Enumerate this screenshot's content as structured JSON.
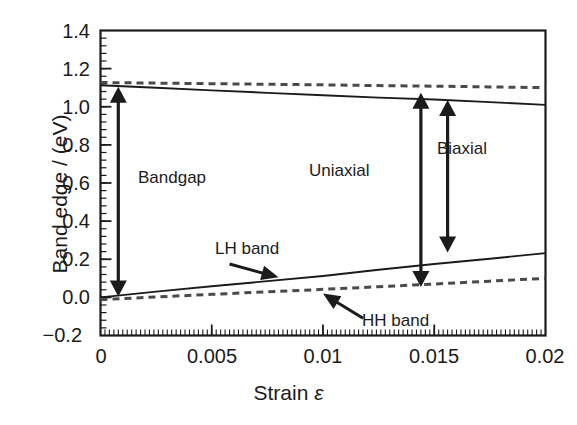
{
  "chart_data": {
    "type": "line",
    "title": "",
    "xlabel": "Strain ε",
    "ylabel": "Band edge / (eV)",
    "xlim": [
      0,
      0.02
    ],
    "ylim": [
      -0.2,
      1.4
    ],
    "xticks": [
      "0",
      "0.005",
      "0.01",
      "0.015",
      "0.02"
    ],
    "xtick_values": [
      0,
      0.005,
      0.01,
      0.015,
      0.02
    ],
    "yticks": [
      "1.4",
      "1.2",
      "1.0",
      "0.8",
      "0.6",
      "0.4",
      "0.2",
      "0.0",
      "−0.2"
    ],
    "ytick_values": [
      1.4,
      1.2,
      1.0,
      0.8,
      0.6,
      0.4,
      0.2,
      0.0,
      -0.2
    ],
    "grid": false,
    "legend": "none",
    "minor_ticks": true,
    "series": [
      {
        "name": "Conduction band (uniaxial, solid)",
        "style": "solid",
        "color": "#1b1b1b",
        "x": [
          0,
          0.0025,
          0.005,
          0.0075,
          0.01,
          0.0125,
          0.015,
          0.0175,
          0.02
        ],
        "values": [
          1.113,
          1.1,
          1.086,
          1.073,
          1.06,
          1.048,
          1.038,
          1.024,
          1.01
        ]
      },
      {
        "name": "Conduction band (biaxial, dashed)",
        "style": "dashed",
        "color": "#4a4a4a",
        "x": [
          0,
          0.0025,
          0.005,
          0.0075,
          0.01,
          0.0125,
          0.015,
          0.0175,
          0.02
        ],
        "values": [
          1.127,
          1.124,
          1.121,
          1.118,
          1.115,
          1.111,
          1.108,
          1.104,
          1.1
        ]
      },
      {
        "name": "LH band",
        "style": "solid",
        "color": "#1b1b1b",
        "x": [
          0,
          0.0025,
          0.005,
          0.0075,
          0.01,
          0.0125,
          0.015,
          0.0175,
          0.02
        ],
        "values": [
          0.0,
          0.03,
          0.058,
          0.085,
          0.112,
          0.145,
          0.175,
          0.203,
          0.232
        ]
      },
      {
        "name": "HH band",
        "style": "dashed",
        "color": "#4a4a4a",
        "x": [
          0,
          0.0025,
          0.005,
          0.0075,
          0.01,
          0.0125,
          0.015,
          0.0175,
          0.02
        ],
        "values": [
          -0.012,
          0.002,
          0.016,
          0.029,
          0.042,
          0.056,
          0.07,
          0.085,
          0.1
        ]
      }
    ],
    "annotations": [
      {
        "name": "bandgap",
        "label": "Bandgap",
        "arrow": "double",
        "x": 0.0008,
        "y_top": 1.105,
        "y_bottom": 0.005,
        "label_x": 0.0022,
        "label_y": 0.585
      },
      {
        "name": "uniaxial",
        "label": "Uniaxial",
        "arrow": "double",
        "x": 0.0144,
        "y_top": 1.073,
        "y_bottom": 0.055,
        "label_x": 0.01,
        "label_y": 0.705
      },
      {
        "name": "biaxial",
        "label": "Biaxial",
        "arrow": "double",
        "x": 0.0156,
        "y_top": 1.035,
        "y_bottom": 0.235,
        "label_x": 0.0172,
        "label_y": 0.82
      },
      {
        "name": "lh-band",
        "label": "LH band",
        "arrow": "pointer",
        "label_x": 0.0065,
        "label_y": 0.28,
        "tail_x": 0.0058,
        "tail_y": 0.175,
        "tip_x": 0.008,
        "tip_y": 0.105
      },
      {
        "name": "hh-band",
        "label": "HH band",
        "arrow": "pointer",
        "label_x": 0.0135,
        "label_y": -0.09,
        "tail_x": 0.0118,
        "tail_y": -0.11,
        "tip_x": 0.01,
        "tip_y": 0.02
      }
    ]
  },
  "axes": {
    "x_title": "Strain ε",
    "x_title_prefix": "Strain ",
    "x_title_symbol": "ε",
    "y_title": "Band edge / (eV)"
  },
  "ticks": {
    "y": [
      "1.4",
      "1.2",
      "1.0",
      "0.8",
      "0.6",
      "0.4",
      "0.2",
      "0.0",
      "−0.2"
    ],
    "x": [
      "0",
      "0.005",
      "0.01",
      "0.015",
      "0.02"
    ]
  },
  "labels": {
    "bandgap": "Bandgap",
    "uniaxial": "Uniaxial",
    "biaxial": "Biaxial",
    "lh_band": "LH band",
    "hh_band": "HH band"
  },
  "colors": {
    "line": "#1b1b1b",
    "dashed": "#4a4a4a",
    "axis": "#1b1b1b",
    "background": "#ffffff"
  }
}
